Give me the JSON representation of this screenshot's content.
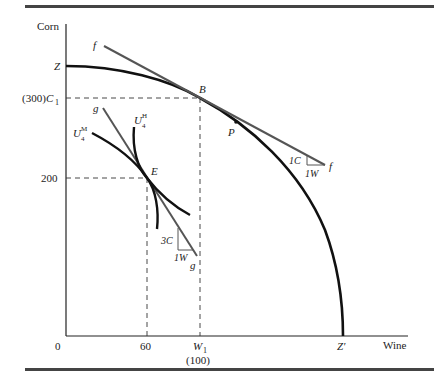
{
  "figure": {
    "axes": {
      "y_label": "Corn",
      "x_label": "Wine",
      "origin_label": "0"
    },
    "y_ticks": {
      "z": "Z",
      "c1_value": "(300)",
      "c1_symbol": "C",
      "c1_sub": "1",
      "v200": "200"
    },
    "x_ticks": {
      "v60": "60",
      "w1_symbol": "W",
      "w1_sub": "1",
      "w1_value": "(100)",
      "zprime": "Z′"
    },
    "points": {
      "b": "B",
      "p": "P",
      "e": "E"
    },
    "lines": {
      "f_top": "f",
      "f_bottom": "f",
      "g_top": "g",
      "g_bottom": "g",
      "f_slope_c": "1C",
      "f_slope_w": "1W",
      "g_slope_c": "3C",
      "g_slope_w": "1W"
    },
    "curves": {
      "u4m_base": "U",
      "u4m_sup": "M",
      "u4m_sub": "4",
      "u4h_base": "U",
      "u4h_sup": "H",
      "u4h_sub": "4"
    },
    "colors": {
      "curve": "#111111",
      "price_line": "#555555",
      "rule": "#444444",
      "axis": "#222222"
    }
  }
}
